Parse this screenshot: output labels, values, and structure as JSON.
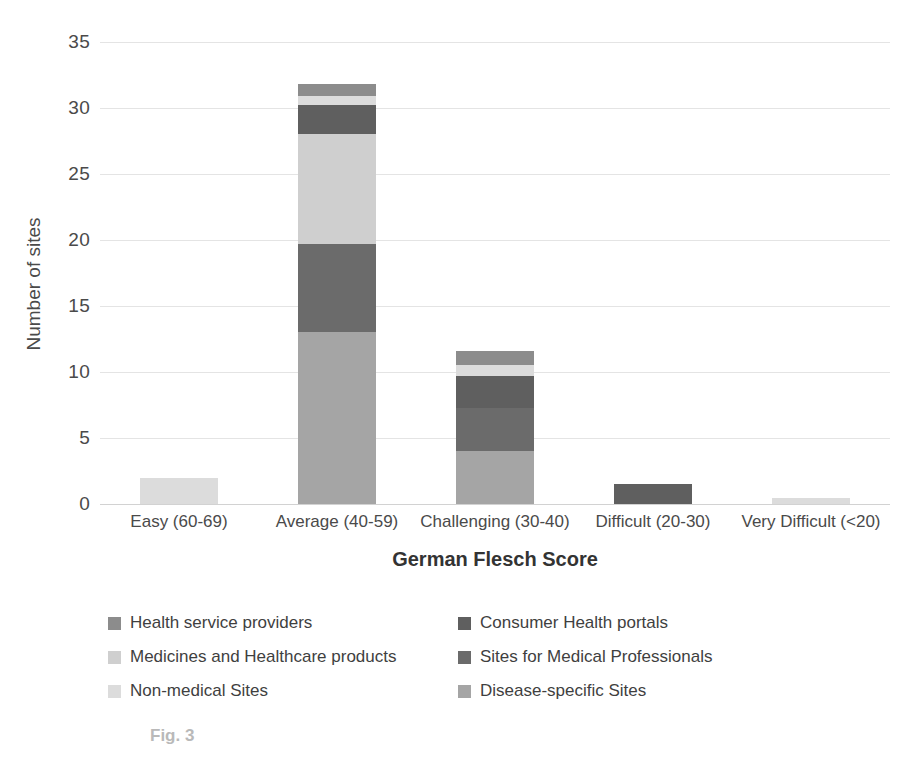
{
  "chart_data": {
    "type": "bar",
    "subtype": "stacked-bar",
    "title": "",
    "xlabel": "German Flesch Score",
    "ylabel": "Number of sites",
    "ylim": [
      0,
      35
    ],
    "yticks": [
      0,
      5,
      10,
      15,
      20,
      25,
      30,
      35
    ],
    "grid": true,
    "legend_position": "bottom",
    "categories": [
      "Easy (60-69)",
      "Average (40-59)",
      "Challenging (30-40)",
      "Difficult (20-30)",
      "Very Difficult (<20)"
    ],
    "series": [
      {
        "name": "Health service providers",
        "color": "#8c8c8c",
        "values": [
          0,
          0.9,
          1.1,
          0,
          0
        ]
      },
      {
        "name": "Consumer Health portals",
        "color": "#5f5f5f",
        "values": [
          0,
          2.2,
          2.4,
          1.5,
          0
        ]
      },
      {
        "name": "Medicines and Healthcare products",
        "color": "#cfcfcf",
        "values": [
          0,
          8.3,
          0,
          0,
          0
        ]
      },
      {
        "name": "Sites for Medical Professionals",
        "color": "#6b6b6b",
        "values": [
          0,
          6.7,
          3.3,
          0,
          0
        ]
      },
      {
        "name": "Non-medical Sites",
        "color": "#dcdcdc",
        "values": [
          2,
          0.7,
          0.8,
          0,
          0.45
        ]
      },
      {
        "name": "Disease-specific Sites",
        "color": "#a5a5a5",
        "values": [
          0,
          13,
          4,
          0,
          0
        ]
      }
    ],
    "stack_order": [
      "Disease-specific Sites",
      "Sites for Medical Professionals",
      "Medicines and Healthcare products",
      "Consumer Health portals",
      "Non-medical Sites",
      "Health service providers"
    ],
    "totals": [
      2,
      31.8,
      11.6,
      1.5,
      0.45
    ]
  },
  "caption": {
    "text": "Fig. 3"
  }
}
